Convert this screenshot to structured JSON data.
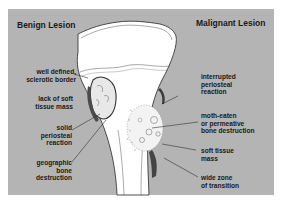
{
  "diagram": {
    "titles": {
      "left": "Benign Lesion",
      "right": "Malignant Lesion"
    },
    "benign_labels": [
      "well defined,\nsclerotic border",
      "lack of soft\ntissue mass",
      "solid\nperiosteal\nreaction",
      "geographic\nbone\ndestruction"
    ],
    "malignant_labels": [
      "interrupted\nperiosteal\nreaction",
      "moth-eaten\nor permeative\nbone destruction",
      "soft tissue\nmass",
      "wide zone\nof transition"
    ],
    "colors": {
      "background_panel": "#b4b4b4",
      "bone": "#ffffff",
      "outline": "#3a3a3a",
      "soft_tissue": "#555555",
      "text": "#1a1a1a"
    }
  }
}
